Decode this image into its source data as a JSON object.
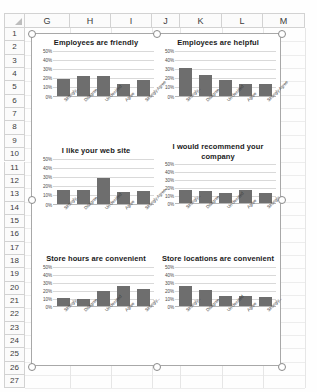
{
  "app": {
    "type": "spreadsheet",
    "select_all_icon": "select-all-triangle-icon"
  },
  "grid": {
    "columns": [
      "G",
      "H",
      "I",
      "J",
      "K",
      "L",
      "M"
    ],
    "rows": [
      "1",
      "2",
      "3",
      "4",
      "5",
      "6",
      "7",
      "8",
      "9",
      "10",
      "11",
      "12",
      "13",
      "14",
      "15",
      "16",
      "17",
      "18",
      "19",
      "20",
      "21",
      "22",
      "23",
      "24",
      "25",
      "26",
      "27"
    ]
  },
  "selection": {
    "name": "chart-group-selection",
    "handles": [
      "top-left",
      "top-center",
      "top-right",
      "middle-left",
      "middle-right",
      "bottom-left",
      "bottom-center",
      "bottom-right"
    ]
  },
  "chart_data": [
    {
      "type": "bar",
      "title": "Employees are friendly",
      "categories": [
        "Strongly...",
        "Disagree",
        "Un-decided",
        "Agree",
        "Strongly Agree"
      ],
      "values": [
        18,
        21,
        21,
        13,
        17
      ],
      "xlabel": "",
      "ylabel": "",
      "ylim": [
        0,
        50
      ],
      "yticks": [
        "0%",
        "10%",
        "20%",
        "30%",
        "40%",
        "50%"
      ],
      "grid": true,
      "legend": "none",
      "bar_color": "#6e6e6e"
    },
    {
      "type": "bar",
      "title": "Employees are helpful",
      "categories": [
        "Strongly...",
        "Disagree",
        "Un-decided",
        "Agree",
        "Strongly Agree"
      ],
      "values": [
        30,
        22,
        17,
        12,
        12
      ],
      "xlabel": "",
      "ylabel": "",
      "ylim": [
        0,
        50
      ],
      "yticks": [
        "0%",
        "10%",
        "20%",
        "30%",
        "40%",
        "50%"
      ],
      "grid": true,
      "legend": "none",
      "bar_color": "#6e6e6e"
    },
    {
      "type": "bar",
      "title": "I like your web site",
      "categories": [
        "Strongly...",
        "Disagree",
        "Un-decided",
        "Agree",
        "Strongly Agree"
      ],
      "values": [
        15,
        15,
        28,
        13,
        14
      ],
      "xlabel": "",
      "ylabel": "",
      "ylim": [
        0,
        50
      ],
      "yticks": [
        "0%",
        "10%",
        "20%",
        "30%",
        "40%",
        "50%"
      ],
      "grid": true,
      "legend": "none",
      "bar_color": "#6e6e6e"
    },
    {
      "type": "bar",
      "title": "I would recommend your company",
      "categories": [
        "Strongly...",
        "Disagree",
        "Un-decided",
        "Agree",
        "Strongly..."
      ],
      "values": [
        16,
        15,
        12,
        16,
        12
      ],
      "xlabel": "",
      "ylabel": "",
      "ylim": [
        0,
        50
      ],
      "yticks": [
        "0%",
        "10%",
        "20%",
        "30%",
        "40%",
        "50%"
      ],
      "grid": true,
      "legend": "none",
      "bar_color": "#6e6e6e"
    },
    {
      "type": "bar",
      "title": "Store hours are convenient",
      "categories": [
        "Strongly...",
        "Disagree",
        "Un-decided",
        "Agree",
        "Strongly..."
      ],
      "values": [
        10,
        8,
        18,
        24,
        21
      ],
      "xlabel": "",
      "ylabel": "",
      "ylim": [
        0,
        50
      ],
      "yticks": [
        "0%",
        "10%",
        "20%",
        "30%",
        "40%",
        "50%"
      ],
      "grid": true,
      "legend": "none",
      "bar_color": "#6e6e6e"
    },
    {
      "type": "bar",
      "title": "Store locations are convenient",
      "categories": [
        "Strongly...",
        "Disagree",
        "Un-decided",
        "Agree",
        "Strongly..."
      ],
      "values": [
        25,
        20,
        12,
        12,
        11
      ],
      "xlabel": "",
      "ylabel": "",
      "ylim": [
        0,
        50
      ],
      "yticks": [
        "0%",
        "10%",
        "20%",
        "30%",
        "40%",
        "50%"
      ],
      "grid": true,
      "legend": "none",
      "bar_color": "#6e6e6e"
    }
  ]
}
